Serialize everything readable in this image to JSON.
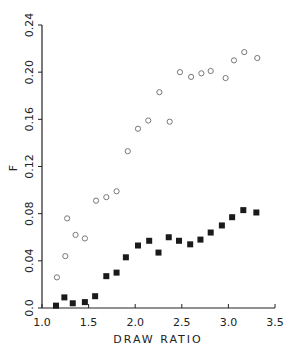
{
  "chart_data": {
    "type": "scatter",
    "title": "",
    "xlabel": "DRAW RATIO",
    "ylabel": "F",
    "xlim": [
      1.0,
      3.5
    ],
    "ylim": [
      0.0,
      0.24
    ],
    "grid": false,
    "legend": "none",
    "x_ticks": [
      "1.0",
      "1.5",
      "2.0",
      "2.5",
      "3.0",
      "3.5"
    ],
    "y_ticks": [
      "0.0",
      "0.04",
      "0.08",
      "0.12",
      "0.16",
      "0.20",
      "0.24"
    ],
    "series": [
      {
        "name": "open circles",
        "marker": "open-circle",
        "points": [
          [
            1.16,
            0.026
          ],
          [
            1.25,
            0.044
          ],
          [
            1.27,
            0.076
          ],
          [
            1.36,
            0.062
          ],
          [
            1.46,
            0.059
          ],
          [
            1.58,
            0.091
          ],
          [
            1.69,
            0.094
          ],
          [
            1.8,
            0.099
          ],
          [
            1.92,
            0.133
          ],
          [
            2.03,
            0.152
          ],
          [
            2.14,
            0.159
          ],
          [
            2.26,
            0.183
          ],
          [
            2.37,
            0.158
          ],
          [
            2.48,
            0.2
          ],
          [
            2.6,
            0.196
          ],
          [
            2.71,
            0.199
          ],
          [
            2.81,
            0.201
          ],
          [
            2.97,
            0.195
          ],
          [
            3.06,
            0.21
          ],
          [
            3.17,
            0.217
          ],
          [
            3.31,
            0.212
          ]
        ]
      },
      {
        "name": "filled squares",
        "marker": "filled-square",
        "points": [
          [
            1.15,
            0.002
          ],
          [
            1.24,
            0.009
          ],
          [
            1.33,
            0.004
          ],
          [
            1.46,
            0.005
          ],
          [
            1.57,
            0.01
          ],
          [
            1.69,
            0.027
          ],
          [
            1.8,
            0.03
          ],
          [
            1.9,
            0.043
          ],
          [
            2.03,
            0.053
          ],
          [
            2.15,
            0.057
          ],
          [
            2.25,
            0.047
          ],
          [
            2.36,
            0.06
          ],
          [
            2.47,
            0.057
          ],
          [
            2.59,
            0.054
          ],
          [
            2.7,
            0.058
          ],
          [
            2.81,
            0.064
          ],
          [
            2.93,
            0.07
          ],
          [
            3.04,
            0.077
          ],
          [
            3.16,
            0.083
          ],
          [
            3.3,
            0.081
          ]
        ]
      }
    ]
  },
  "colors": {
    "axis": "#222222",
    "circle_stroke": "#777777",
    "square_fill": "#1a1a1a"
  }
}
